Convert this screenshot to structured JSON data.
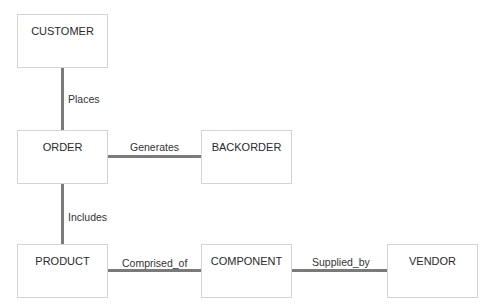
{
  "entities": [
    {
      "id": "customer",
      "label": "CUSTOMER"
    },
    {
      "id": "order",
      "label": "ORDER"
    },
    {
      "id": "backorder",
      "label": "BACKORDER"
    },
    {
      "id": "product",
      "label": "PRODUCT"
    },
    {
      "id": "component",
      "label": "COMPONENT"
    },
    {
      "id": "vendor",
      "label": "VENDOR"
    }
  ],
  "relationships": [
    {
      "from": "customer",
      "to": "order",
      "label": "Places"
    },
    {
      "from": "order",
      "to": "backorder",
      "label": "Generates"
    },
    {
      "from": "order",
      "to": "product",
      "label": "Includes"
    },
    {
      "from": "product",
      "to": "component",
      "label": "Comprised_of"
    },
    {
      "from": "component",
      "to": "vendor",
      "label": "Supplied_by"
    }
  ]
}
